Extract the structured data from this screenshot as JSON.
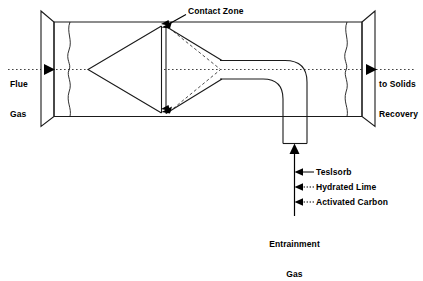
{
  "diagram": {
    "colors": {
      "line": "#1a1a1a",
      "text": "#000000",
      "background": "#ffffff",
      "dashed": "#333333"
    },
    "labels": {
      "contact_zone": "Contact Zone",
      "flue_gas_line1": "Flue",
      "flue_gas_line2": "Gas",
      "to_solids_line1": "to Solids",
      "to_solids_line2": "Recovery",
      "entrainment_line1": "Entrainment",
      "entrainment_line2": "Gas"
    },
    "additives": [
      {
        "name": "Teslsorb",
        "leader": "solid"
      },
      {
        "name": "Hydrated Lime",
        "leader": "dotted"
      },
      {
        "name": "Activated Carbon",
        "leader": "dotted"
      }
    ]
  }
}
